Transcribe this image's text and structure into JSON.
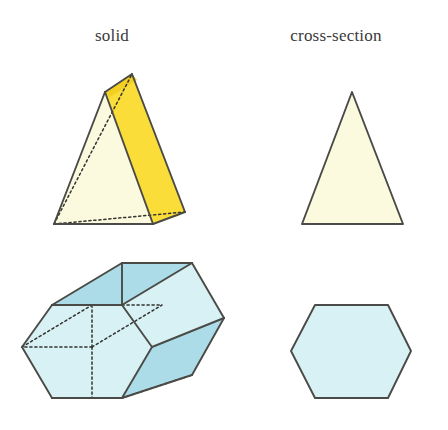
{
  "figure": {
    "background_color": "#ffffff",
    "width": 448,
    "height": 430
  },
  "headers": {
    "solid_label": "solid",
    "cross_section_label": "cross-section"
  },
  "colors": {
    "cream_light": "#FBF9DE",
    "yellow_bright": "#FADD39",
    "yellow_shadow": "#F2CF22",
    "blue_light": "#D8F1F5",
    "blue_medium": "#ACDCE7",
    "blue_dark": "#96D0DF",
    "edge_stroke": "#4a4a46",
    "hidden_stroke": "#33332f",
    "text": "#3a3a3a"
  },
  "rows": [
    {
      "name": "triangular-prism-row",
      "solid": {
        "shape_name": "triangular-prism",
        "description": "triangular prism standing on a rectangular face, shown in oblique view",
        "front_face": {
          "name": "front-triangle-face",
          "points": "105,92 54,224 153,224",
          "fill": "#FBF9DE"
        },
        "cut_face": {
          "name": "highlighted-cut-face",
          "points": "105,92 132,74 185,212 153,224",
          "fill": "#FADD39"
        },
        "cut_face_shadow": {
          "name": "cut-face-shadow-strip",
          "points": "153,224 185,212 178,216",
          "fill": "#F2CF22"
        },
        "top_wedge": {
          "name": "top-edge-wedge",
          "points": "105,92 132,74 137,80 110,97",
          "fill": "#F2CF22"
        },
        "visible_edges": [
          "M105,92 L54,224",
          "M54,224 L153,224",
          "M153,224 L105,92",
          "M105,92 L132,74",
          "M132,74 L185,212",
          "M185,212 L153,224"
        ],
        "hidden_edges": [
          "M54,224 L132,74",
          "M54,224 L185,212"
        ]
      },
      "cross_section": {
        "shape_name": "triangle-cross-section",
        "description": "isosceles triangle cross-section",
        "points": "352,92 302,224 403,224",
        "fill": "#FBF9DE"
      }
    },
    {
      "name": "hexagonal-prism-row",
      "solid": {
        "shape_name": "hexagonal-prism",
        "description": "hexagonal prism lying on its side, shown in oblique view",
        "faces": [
          {
            "name": "left-hexagon-face",
            "points": "52,305 122,305 152,347 122,398 52,398 22,347",
            "fill": "#D8F1F5"
          },
          {
            "name": "top-left-slant-face",
            "points": "52,305 122,305 192,263 122,263",
            "fill": "#ACDCE7"
          },
          {
            "name": "top-right-face",
            "points": "122,305 192,263 224,318 152,347",
            "fill": "#D8F1F5"
          },
          {
            "name": "right-upper-face",
            "points": "192,263 224,318 224,318 192,263",
            "fill": "#ACDCE7"
          },
          {
            "name": "bottom-right-slant-face",
            "points": "152,347 224,318 192,375 122,398",
            "fill": "#ACDCE7"
          }
        ],
        "visible_edges": [
          "M52,305 L122,305",
          "M122,305 L152,347",
          "M152,347 L122,398",
          "M122,398 L52,398",
          "M52,398 L22,347",
          "M22,347 L52,305",
          "M52,305 L122,263",
          "M122,263 L192,263",
          "M192,263 L224,318",
          "M224,318 L192,375",
          "M192,375 L122,398",
          "M122,305 L192,263",
          "M152,347 L224,318",
          "M122,305 L122,263"
        ],
        "hidden_edges": [
          "M22,347 L92,305",
          "M92,305 L162,305",
          "M92,305 L92,347",
          "M92,347 L92,398",
          "M92,347 L162,305",
          "M122,398 L192,375",
          "M92,347 L22,347"
        ]
      },
      "cross_section": {
        "shape_name": "hexagon-cross-section",
        "description": "regular hexagon cross-section",
        "points": "315,305 388,305 411,351 388,398 315,398 291,351",
        "fill": "#D8F1F5"
      }
    }
  ]
}
